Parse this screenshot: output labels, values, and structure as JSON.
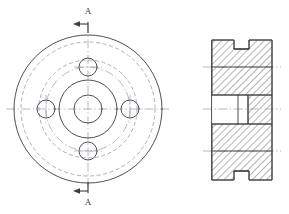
{
  "drawing": {
    "title": "Flanged Hub - Orthographic Drawing",
    "canvas": {
      "width": 289,
      "height": 214,
      "background": "#ffffff"
    },
    "colors": {
      "outline": "#3a3a42",
      "hidden": "#9a9aa6",
      "center": "#9a9aa6",
      "hatch": "#3a3a42",
      "background": "#ffffff"
    },
    "section_label": "A",
    "section_label_top": "A",
    "section_label_bottom": "A",
    "front_view": {
      "name": "front-view",
      "center": {
        "x": 88,
        "y": 109
      },
      "outer_diameter_circle_r": 74,
      "rim_hidden_circle_r": 67,
      "inner_hidden_circle_r": 49,
      "hub_outer_circle_r": 29,
      "bore_circle_r": 14,
      "bolt_circle_r": 42,
      "bolt_hole_r": 9,
      "bolt_hole_count": 4,
      "bolt_hole_angles_deg": [
        90,
        0,
        270,
        180
      ]
    },
    "section_view": {
      "name": "section-view-a-a",
      "left": 212,
      "right": 272,
      "top": 40,
      "bottom": 180,
      "bore_left": 212,
      "bore_step_x": 238,
      "bore_right": 248,
      "bore_top": 95,
      "bore_bottom": 124,
      "keyway_top": {
        "x": 234,
        "width": 15,
        "depth": 9
      },
      "keyway_bottom": {
        "x": 234,
        "width": 15,
        "depth": 9
      },
      "hatch_angle_deg": 45
    }
  }
}
